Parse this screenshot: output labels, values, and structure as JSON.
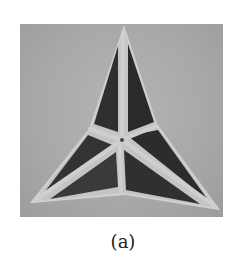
{
  "figure": {
    "caption": "(a)",
    "image": {
      "subject": "folded tri-star origami structure with dark triangular panels and light frame edges on gray background",
      "colors": {
        "background": "#ababab",
        "panel": "#2e2e2e",
        "frame": "#c8c8c8"
      }
    }
  }
}
